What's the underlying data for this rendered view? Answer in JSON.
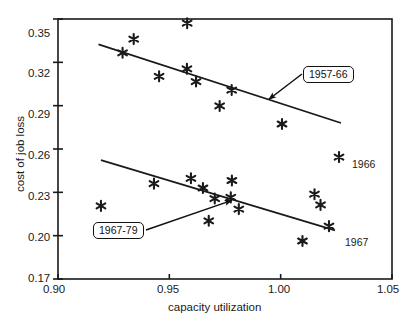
{
  "chart_data": {
    "type": "scatter",
    "title": "",
    "xlabel": "capacity utilization",
    "ylabel": "cost of job loss",
    "xlim": [
      0.9,
      1.05
    ],
    "ylim": [
      0.17,
      0.35
    ],
    "xticks": [
      "0.90",
      "0.95",
      "1.00",
      "1.05"
    ],
    "xtick_values": [
      0.9,
      0.95,
      1.0,
      1.05
    ],
    "yticks": [
      "0.17",
      "0.20",
      "0.23",
      "0.26",
      "0.29",
      "0.32",
      "0.35"
    ],
    "ytick_values": [
      0.17,
      0.2,
      0.23,
      0.26,
      0.29,
      0.32,
      0.35
    ],
    "grid": false,
    "legend": "none",
    "marker": "asterisk",
    "marker_color": "#1a1a1a",
    "line_color": "#1a1a1a",
    "frame": "box",
    "series": [
      {
        "name": "1957-66",
        "points": [
          {
            "x": 0.929,
            "y": 0.3266
          },
          {
            "x": 0.934,
            "y": 0.3361
          },
          {
            "x": 0.958,
            "y": 0.3471
          },
          {
            "x": 0.9454,
            "y": 0.3103
          },
          {
            "x": 0.9579,
            "y": 0.3155
          },
          {
            "x": 0.962,
            "y": 0.3067
          },
          {
            "x": 0.978,
            "y": 0.3008
          },
          {
            "x": 0.9726,
            "y": 0.2898
          },
          {
            "x": 1.0006,
            "y": 0.2773
          },
          {
            "x": 1.0262,
            "y": 0.2544
          }
        ],
        "annotated_points": [
          {
            "label": "1966",
            "x": 1.0262,
            "y": 0.2544
          }
        ],
        "trend_line": {
          "x1": 0.9182,
          "y1": 0.3324,
          "x2": 1.0271,
          "y2": 0.278
        },
        "callout": {
          "text": "1957-66",
          "arrow_to_x": 0.9937,
          "arrow_to_y": 0.2929
        }
      },
      {
        "name": "1967-79",
        "points": [
          {
            "x": 0.9193,
            "y": 0.2206
          },
          {
            "x": 0.9431,
            "y": 0.236
          },
          {
            "x": 0.9597,
            "y": 0.2397
          },
          {
            "x": 0.9651,
            "y": 0.233
          },
          {
            "x": 0.9677,
            "y": 0.2103
          },
          {
            "x": 0.9704,
            "y": 0.2257
          },
          {
            "x": 0.9776,
            "y": 0.2265
          },
          {
            "x": 0.9781,
            "y": 0.2382
          },
          {
            "x": 0.9812,
            "y": 0.2184
          },
          {
            "x": 1.0152,
            "y": 0.2287
          },
          {
            "x": 1.0179,
            "y": 0.2213
          },
          {
            "x": 1.0098,
            "y": 0.1963
          },
          {
            "x": 1.0217,
            "y": 0.2066
          }
        ],
        "annotated_points": [
          {
            "label": "1967",
            "x": 1.0217,
            "y": 0.2066
          }
        ],
        "trend_line": {
          "x1": 0.9193,
          "y1": 0.2523,
          "x2": 1.0244,
          "y2": 0.2037
        },
        "callout": {
          "text": "1967-79",
          "arrow_to_x": 0.979,
          "arrow_to_y": 0.2272
        }
      }
    ]
  },
  "axes": {
    "x_title": "capacity utilization",
    "y_title": "cost of job loss"
  }
}
